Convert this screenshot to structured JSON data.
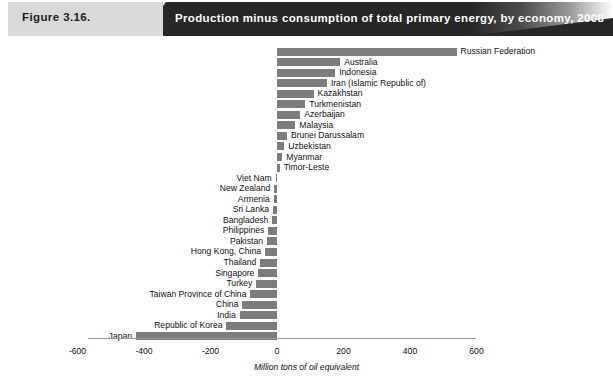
{
  "banner": {
    "figure_number": "Figure 3.16.",
    "title": "Production minus consumption of total primary energy, by economy, 2008"
  },
  "footer": {
    "source_note": ""
  },
  "chart_data": {
    "type": "bar",
    "orientation": "horizontal",
    "title": "Production minus consumption of total primary energy, by economy, 2008",
    "xlabel": "Million tons of oil equivalent",
    "ylabel": "",
    "xlim": [
      -600,
      600
    ],
    "xticks": [
      -600,
      -400,
      -200,
      0,
      200,
      400,
      600
    ],
    "xticklabels": [
      "-600",
      "-400",
      "-200",
      "0",
      "200",
      "400",
      "600"
    ],
    "grid": false,
    "legend": null,
    "bar_color": "#7d7d7d",
    "categories": [
      "Russian Federation",
      "Australia",
      "Indonesia",
      "Iran (Islamic Republic of)",
      "Kazakhstan",
      "Turkmenistan",
      "Azerbaijan",
      "Malaysia",
      "Brunei Darussalam",
      "Uzbekistan",
      "Myanmar",
      "Timor-Leste",
      "Viet Nam",
      "New Zealand",
      "Armenia",
      "Sri Lanka",
      "Bangladesh",
      "Philippines",
      "Pakistan",
      "Hong Kong, China",
      "Thailand",
      "Singapore",
      "Turkey",
      "Taiwan Province of China",
      "China",
      "India",
      "Republic of Korea",
      "Japan"
    ],
    "values": [
      540,
      190,
      175,
      150,
      110,
      85,
      70,
      55,
      30,
      22,
      16,
      8,
      -4,
      -8,
      -10,
      -12,
      -14,
      -26,
      -30,
      -36,
      -50,
      -56,
      -62,
      -80,
      -104,
      -112,
      -152,
      -424
    ]
  }
}
